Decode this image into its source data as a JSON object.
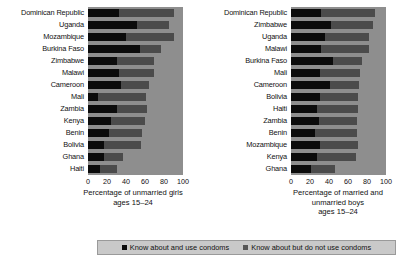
{
  "chart_data": [
    {
      "type": "bar",
      "orientation": "horizontal",
      "stacked": true,
      "title": "",
      "xlabel": "Percentage of unmarried girls ages 15–24",
      "ylabel": "",
      "xlim": [
        0,
        100
      ],
      "xticks": [
        0,
        20,
        40,
        60,
        80,
        100
      ],
      "grid": true,
      "legend_position": "bottom",
      "categories": [
        "Dominican Republic",
        "Uganda",
        "Mozambique",
        "Burkina Faso",
        "Zimbabwe",
        "Malawi",
        "Cameroon",
        "Mali",
        "Zambia",
        "Kenya",
        "Benin",
        "Bolivia",
        "Ghana",
        "Haiti"
      ],
      "series": [
        {
          "name": "Know about and use condoms",
          "color": "#0b0b0b",
          "values": [
            33,
            52,
            40,
            55,
            31,
            33,
            35,
            11,
            31,
            24,
            22,
            17,
            17,
            13
          ]
        },
        {
          "name": "Know about but do not use condoms",
          "color": "#4b4b4b",
          "values": [
            58,
            33,
            50,
            22,
            38,
            36,
            29,
            50,
            31,
            36,
            35,
            39,
            20,
            18
          ]
        }
      ],
      "totals": [
        91,
        85,
        90,
        77,
        69,
        69,
        64,
        61,
        62,
        60,
        57,
        56,
        37,
        31
      ]
    },
    {
      "type": "bar",
      "orientation": "horizontal",
      "stacked": true,
      "title": "",
      "xlabel": "Percentage of married and unmarried boys ages 15–24",
      "ylabel": "",
      "xlim": [
        0,
        100
      ],
      "xticks": [
        0,
        20,
        40,
        60,
        80,
        100
      ],
      "grid": true,
      "legend_position": "bottom",
      "categories": [
        "Dominican Republic",
        "Zimbabwe",
        "Uganda",
        "Malawi",
        "Burkina Faso",
        "Mali",
        "Cameroon",
        "Bolivia",
        "Haiti",
        "Zambia",
        "Benin",
        "Mozambique",
        "Kenya",
        "Ghana"
      ],
      "series": [
        {
          "name": "Know about and use condoms",
          "color": "#0b0b0b",
          "values": [
            32,
            42,
            36,
            32,
            44,
            30,
            41,
            31,
            27,
            29,
            25,
            30,
            27,
            21
          ]
        },
        {
          "name": "Know about but do not use condoms",
          "color": "#4b4b4b",
          "values": [
            56,
            44,
            46,
            50,
            31,
            43,
            31,
            40,
            44,
            41,
            44,
            41,
            41,
            25
          ]
        }
      ],
      "totals": [
        88,
        86,
        82,
        82,
        75,
        73,
        72,
        71,
        71,
        70,
        69,
        71,
        68,
        46
      ]
    }
  ],
  "left_panel": {
    "axis_title_lines": [
      "Percentage of unmarried girls",
      "ages 15–24"
    ],
    "tick_labels": [
      "0",
      "20",
      "40",
      "60",
      "80",
      "100"
    ]
  },
  "right_panel": {
    "axis_title_lines": [
      "Percentage of married and",
      "unmarried boys",
      "ages 15–24"
    ],
    "tick_labels": [
      "0",
      "20",
      "40",
      "60",
      "80",
      "100"
    ]
  },
  "legend": {
    "items": [
      {
        "label": "Know about and use condoms",
        "color": "#0b0b0b",
        "swatch": "square-marker-icon"
      },
      {
        "label": "Know about but do not use condoms",
        "color": "#565656",
        "swatch": "square-marker-icon"
      }
    ]
  }
}
